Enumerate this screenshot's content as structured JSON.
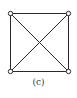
{
  "figure": {
    "caption": "(c)",
    "colors": {
      "stroke": "#2a2a2a",
      "vertex_fill": "#ffffff",
      "background": "#ffffff"
    },
    "vertices": [
      {
        "id": "top-left",
        "x": 10,
        "y": 13
      },
      {
        "id": "top-right",
        "x": 68,
        "y": 13
      },
      {
        "id": "bottom-right",
        "x": 68,
        "y": 71
      },
      {
        "id": "bottom-left",
        "x": 10,
        "y": 71
      }
    ],
    "edges": [
      {
        "from": "top-left",
        "to": "top-right"
      },
      {
        "from": "top-right",
        "to": "bottom-right"
      },
      {
        "from": "bottom-right",
        "to": "bottom-left"
      },
      {
        "from": "bottom-left",
        "to": "top-left"
      },
      {
        "from": "top-left",
        "to": "bottom-right"
      },
      {
        "from": "top-right",
        "to": "bottom-left"
      }
    ]
  }
}
